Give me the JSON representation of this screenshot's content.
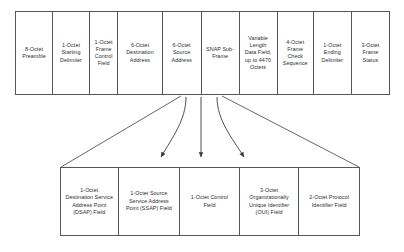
{
  "diagram": {
    "line_color": "#55565a",
    "text_color": "#2d2d2f",
    "background_color": "#ffffff",
    "top_row": {
      "name": "frame-fields-row",
      "cells": [
        {
          "label": "8-Octet\nPreamble",
          "width_pct": 10.9
        },
        {
          "label": "1-Octet\nStarting\nDelimiter",
          "width_pct": 10.9
        },
        {
          "label": "1-Octet\nFrame\nControl\nField",
          "width_pct": 8.3
        },
        {
          "label": "6-Octet\nDestination\nAddress",
          "width_pct": 13.1
        },
        {
          "label": "6-Octet\nSource\nAddress",
          "width_pct": 11.5
        },
        {
          "label": "SNAP Sub-\nFrame",
          "width_pct": 11.2
        },
        {
          "label": "Variable\nLength\nData Field,\nup to 4470\nOctets",
          "width_pct": 11.2
        },
        {
          "label": "4-Octet\nFrame\nCheck\nSequence",
          "width_pct": 10.7
        },
        {
          "label": "1-Octet\nEnding\nDelimiter",
          "width_pct": 11.2
        },
        {
          "label": "3-Octet\nFrame\nStatus",
          "width_pct": 11.0
        }
      ]
    },
    "bottom_row": {
      "name": "snap-subframe-fields-row",
      "cells": [
        {
          "label": "1-Octet\nDestination Service\nAddress Point\n(DSAP) Field",
          "width_pct": 19.3
        },
        {
          "label": "1-Octet Source\nService Address\nPoint (SSAP) Field",
          "width_pct": 20.7
        },
        {
          "label": "1-Octet Control\nField",
          "width_pct": 20.0
        },
        {
          "label": "3-Octet\nOrganizationally\nUnique Identifier\n(OUI) Field",
          "width_pct": 20.0
        },
        {
          "label": "2-Octet Protocol\nIdentifier Field",
          "width_pct": 20.0
        }
      ]
    },
    "connectors": {
      "expansion_left_line": "from SNAP sub-frame left edge down-left to bottom row left corner",
      "expansion_right_line": "from SNAP sub-frame right edge down-right to bottom row right corner",
      "arrows": [
        {
          "name": "snap-arrow-left",
          "from_x": 183,
          "to_x": 160
        },
        {
          "name": "snap-arrow-center",
          "from_x": 201,
          "to_x": 215
        },
        {
          "name": "snap-arrow-right",
          "from_x": 218,
          "to_x": 272
        }
      ]
    }
  }
}
